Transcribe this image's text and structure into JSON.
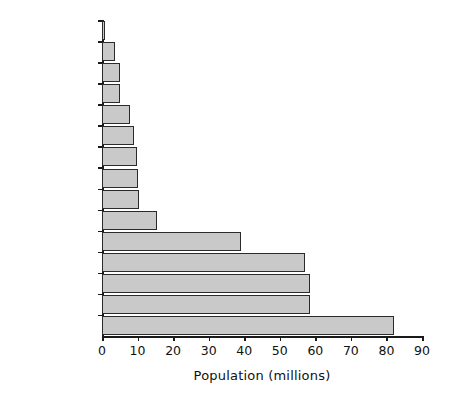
{
  "chart_data": {
    "type": "bar",
    "orientation": "horizontal",
    "title": "",
    "xlabel": "Population (millions)",
    "ylabel": "",
    "xlim": [
      0,
      90
    ],
    "xticks": [
      0,
      10,
      20,
      30,
      40,
      50,
      60,
      70,
      80,
      90
    ],
    "xtick_labels": [
      "0",
      "10",
      "20",
      "30",
      "40",
      "50",
      "60",
      "70",
      "80",
      "90"
    ],
    "grid": false,
    "legend": null,
    "categories": [
      "Luxembourg",
      "Ireland",
      "Finland",
      "Denmark",
      "Austria",
      "Sweden",
      "Portugal",
      "Belgium",
      "Greece",
      "Netherlands",
      "Spain",
      "Italy",
      "UK",
      "France",
      "Germany"
    ],
    "values": [
      0.4,
      3.6,
      5.1,
      5.2,
      8.0,
      8.9,
      9.9,
      10.1,
      10.5,
      15.6,
      39.0,
      57.2,
      58.4,
      58.6,
      82.0
    ],
    "series": [
      {
        "name": "Population (millions)",
        "values": [
          0.4,
          3.6,
          5.1,
          5.2,
          8.0,
          8.9,
          9.9,
          10.1,
          10.5,
          15.6,
          39.0,
          57.2,
          58.4,
          58.6,
          82.0
        ]
      }
    ],
    "bar_fill_color": "#c9c9c9",
    "bar_edge_color": "#2b2b2b",
    "axis_color": "#1a1a1a",
    "background_color": "#ffffff"
  }
}
